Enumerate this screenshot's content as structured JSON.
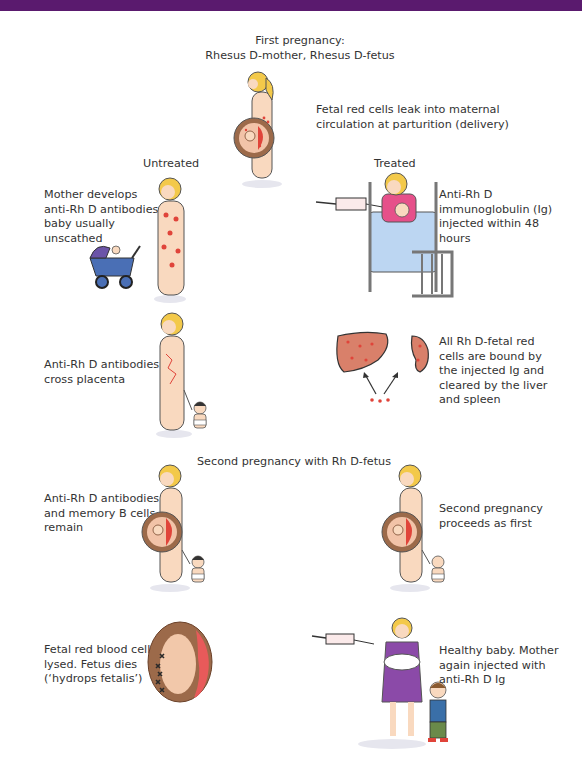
{
  "header_bar": {
    "color": "#5a1a6e"
  },
  "first_pregnancy": {
    "title_line1": "First pregnancy:",
    "title_line2": "Rhesus D-mother, Rhesus D-fetus",
    "caption_line1": "Fetal red cells leak into maternal",
    "caption_line2": "circulation at parturition (delivery)"
  },
  "columns": {
    "untreated": "Untreated",
    "treated": "Treated"
  },
  "untreated": {
    "step1": [
      "Mother develops",
      "anti-Rh D antibodies;",
      "baby usually",
      "unscathed"
    ],
    "step2": [
      "Anti-Rh D antibodies",
      "cross placenta"
    ],
    "step3": [
      "Anti-Rh D antibodies",
      "and memory B cells",
      "remain"
    ],
    "step4": [
      "Fetal red blood cells",
      "lysed. Fetus dies",
      "(‘hydrops fetalis’)"
    ]
  },
  "treated": {
    "step1": [
      "Anti-Rh D",
      "immunoglobulin (Ig)",
      "injected within 48",
      "hours"
    ],
    "step2": [
      "All Rh D-fetal red",
      "cells are bound by",
      "the injected Ig and",
      "cleared by the liver",
      "and spleen"
    ],
    "step3": [
      "Second pregnancy",
      "proceeds as first"
    ],
    "step4": [
      "Healthy baby. Mother",
      "again injected with",
      "anti-Rh D Ig"
    ]
  },
  "second_pregnancy": {
    "title": "Second pregnancy with Rh D-fetus"
  },
  "colors": {
    "skin": "#f9d9bf",
    "hair": "#f3c94a",
    "red_cells": "#e0443a",
    "organ": "#d9806a",
    "womb": "#9c6a4a",
    "blanket": "#bcd6f2",
    "pram": "#4a6fb5",
    "dress": "#8b4aa8"
  }
}
